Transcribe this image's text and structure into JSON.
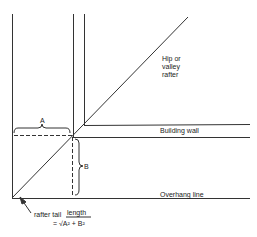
{
  "labels": {
    "hip_rafter": [
      "Hip or",
      "valley",
      "rafter"
    ],
    "building_wall": "Building wall",
    "overhang_line": "Overhang line",
    "dim_a": "A",
    "dim_b": "B",
    "rafter_tail": "rafter tail",
    "length": "length",
    "formula": "= √A² + B²"
  }
}
